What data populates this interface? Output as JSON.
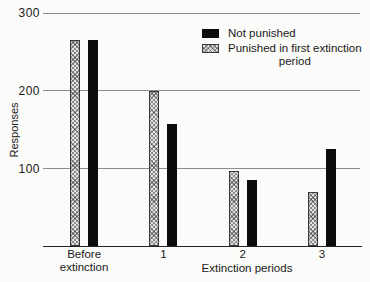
{
  "chart_data": {
    "type": "bar",
    "title": "",
    "categories": [
      "Before extinction",
      "1",
      "2",
      "3"
    ],
    "series": [
      {
        "name": "Punished in first extinction period",
        "pattern": "hatched",
        "values": [
          265,
          200,
          97,
          70
        ]
      },
      {
        "name": "Not punished",
        "pattern": "solid",
        "values": [
          265,
          157,
          85,
          125
        ]
      }
    ],
    "xlabel": "Extinction periods",
    "ylabel": "Responses",
    "yticks": [
      100,
      200,
      300
    ],
    "ylim": [
      0,
      300
    ],
    "grid": "horizontal-gridlines",
    "legend": {
      "position": "top-right",
      "items": [
        {
          "swatch": "solid-black",
          "lines": [
            "Not punished"
          ]
        },
        {
          "swatch": "hatched",
          "lines": [
            "Punished in first extinction",
            "period"
          ]
        }
      ]
    },
    "colors": {
      "bar_solid": "#0c0c0c",
      "bar_hatch_bg": "#e3e3e3",
      "bar_hatch_line": "#3a3a3a",
      "gridline": "#8d8d8d",
      "axis_line": "#222222",
      "text": "#1a1a1a",
      "background": "#fbfbf9"
    }
  }
}
